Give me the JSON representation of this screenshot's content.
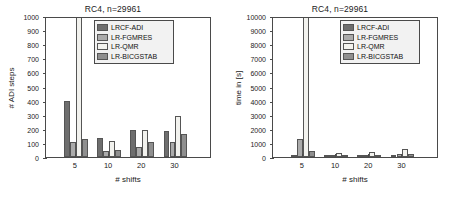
{
  "figure": {
    "series_names": [
      "LRCF-ADI",
      "LR-FGMRES",
      "LR-QMR",
      "LR-BICGSTAB"
    ],
    "series_colors": [
      "#6e6e6e",
      "#ababab",
      "#f2f2ee",
      "#8f8f8f"
    ]
  },
  "chart_data": [
    {
      "type": "bar",
      "title": "RC4, n=29961",
      "xlabel": "# shifts",
      "ylabel": "# ADI steps",
      "categories": [
        "5",
        "10",
        "20",
        "30"
      ],
      "xticklabels": [
        "5",
        "10",
        "20",
        "30"
      ],
      "yticklabels": [
        "0",
        "100",
        "200",
        "300",
        "400",
        "500",
        "600",
        "700",
        "800",
        "900",
        "1000"
      ],
      "ylim": [
        0,
        1000
      ],
      "yticks": [
        0,
        100,
        200,
        300,
        400,
        500,
        600,
        700,
        800,
        900,
        1000
      ],
      "grid": false,
      "legend": [
        "LRCF-ADI",
        "LR-FGMRES",
        "LR-QMR",
        "LR-BICGSTAB"
      ],
      "legend_position": "top-center",
      "series": [
        {
          "name": "LRCF-ADI",
          "values": [
            395,
            138,
            192,
            188
          ]
        },
        {
          "name": "LR-FGMRES",
          "values": [
            110,
            44,
            70,
            108
          ]
        },
        {
          "name": "LR-QMR",
          "values": [
            1000,
            115,
            192,
            288
          ]
        },
        {
          "name": "LR-BICGSTAB",
          "values": [
            130,
            52,
            110,
            165
          ]
        }
      ]
    },
    {
      "type": "bar",
      "title": "RC4, n=29961",
      "xlabel": "# shifts",
      "ylabel": "time in [s]",
      "categories": [
        "5",
        "10",
        "20",
        "30"
      ],
      "xticklabels": [
        "5",
        "10",
        "20",
        "30"
      ],
      "yticklabels": [
        "0",
        "1000",
        "2000",
        "3000",
        "4000",
        "5000",
        "6000",
        "7000",
        "8000",
        "9000",
        "10000"
      ],
      "ylim": [
        0,
        10000
      ],
      "yticks": [
        0,
        1000,
        2000,
        3000,
        4000,
        5000,
        6000,
        7000,
        8000,
        9000,
        10000
      ],
      "grid": false,
      "legend": [
        "LRCF-ADI",
        "LR-FGMRES",
        "LR-QMR",
        "LR-BICGSTAB"
      ],
      "legend_position": "top-right",
      "series": [
        {
          "name": "LRCF-ADI",
          "values": [
            105,
            60,
            50,
            60
          ]
        },
        {
          "name": "LR-FGMRES",
          "values": [
            1270,
            120,
            120,
            220
          ]
        },
        {
          "name": "LR-QMR",
          "values": [
            10000,
            300,
            390,
            540
          ]
        },
        {
          "name": "LR-BICGSTAB",
          "values": [
            420,
            150,
            130,
            180
          ]
        }
      ]
    }
  ]
}
